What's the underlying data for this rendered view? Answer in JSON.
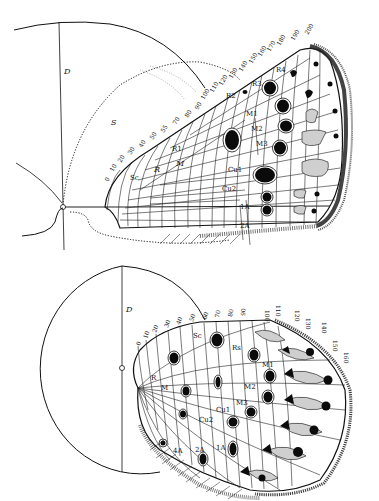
{
  "figure": {
    "header_fragment": "",
    "upper_wing": {
      "name": "forewing",
      "circle_label": "D",
      "dotted_outline_label": "S",
      "scale_ticks": [
        "0",
        "10",
        "20",
        "30",
        "40",
        "50",
        "55",
        "70",
        "80",
        "90",
        "100",
        "110",
        "120",
        "130",
        "140",
        "150",
        "160",
        "170",
        "180",
        "190",
        "200"
      ],
      "vein_labels": {
        "Sc": "Sc",
        "R": "R",
        "R1": "R1",
        "R2": "R2",
        "R3": "R3",
        "R4": "R4",
        "M": "M",
        "M1": "M1",
        "M2": "M2",
        "M3": "M3",
        "Cu1": "Cu1",
        "Cu2": "Cu2",
        "A1": "1A",
        "A2": "2A"
      }
    },
    "lower_wing": {
      "name": "hindwing",
      "circle_label": "D",
      "scale_ticks": [
        "0",
        "10",
        "20",
        "30",
        "40",
        "50",
        "60",
        "70",
        "80",
        "90",
        "100",
        "110",
        "120",
        "130",
        "140",
        "150",
        "160"
      ],
      "vein_labels": {
        "Sc": "Sc",
        "Rs": "Rs",
        "R": "R",
        "M": "M",
        "M1": "M1",
        "M2": "M2",
        "M3": "M3",
        "Cu1": "Cu1",
        "Cu2": "Cu2",
        "A1": "1A",
        "A2": "2A",
        "A4": "4A"
      }
    }
  }
}
